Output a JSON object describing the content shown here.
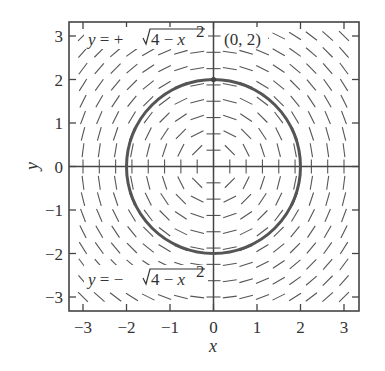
{
  "figure": {
    "type": "slope_field",
    "equation": "dy/dx = -x/y",
    "xlabel": "x",
    "ylabel": "y",
    "xlim": [
      -3.25,
      3.25
    ],
    "ylim": [
      -3.25,
      3.25
    ],
    "xticks": [
      "-3",
      "-2",
      "-1",
      "0",
      "1",
      "2",
      "3"
    ],
    "yticks": [
      "3",
      "2",
      "1",
      "0",
      "-1",
      "-2",
      "-3"
    ],
    "field_spacing": 0.375,
    "solution_curve": {
      "shape": "circle",
      "center": [
        0,
        0
      ],
      "radius": 2
    },
    "point": {
      "label": "(0, 2)",
      "x": 0,
      "y": 2
    },
    "annotations": {
      "upper_prefix": "y = +",
      "upper_radicand": "4 − x",
      "lower_prefix": "y = −",
      "lower_radicand": "4 − x",
      "exponent": "2"
    },
    "colors": {
      "curve": "#555555",
      "axes": "#444444",
      "segments": "#555555",
      "frame": "#444444"
    }
  }
}
